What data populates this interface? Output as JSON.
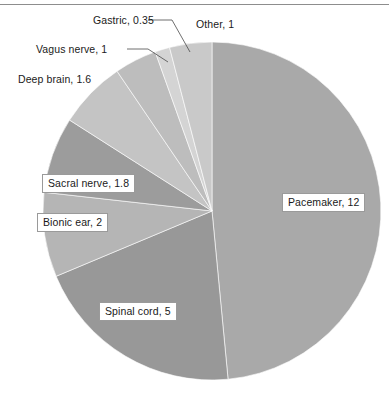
{
  "figure": {
    "rule_top": true,
    "caption_fragment": ""
  },
  "chart_data": {
    "type": "pie",
    "title": "",
    "subtitle": "",
    "xlabel": "",
    "ylabel": "",
    "grid": false,
    "legend_position": "none",
    "value_unit": "",
    "total": 24.75,
    "label_format": "name, value",
    "start_angle_deg": 0,
    "direction": "clockwise",
    "categories": [
      "Pacemaker",
      "Spinal cord",
      "Bionic ear",
      "Sacral nerve",
      "Deep brain",
      "Vagus nerve",
      "Gastric",
      "Other"
    ],
    "values": [
      12,
      5,
      2,
      1.8,
      1.6,
      1,
      0.35,
      1
    ],
    "colors": [
      "#a9a9a9",
      "#989898",
      "#b5b5b5",
      "#9c9c9c",
      "#c4c4c4",
      "#bdbdbd",
      "#d4d4d4",
      "#c9c9c9"
    ],
    "data_labels": [
      "Pacemaker, 12",
      "Spinal cord, 5",
      "Bionic ear, 2",
      "Sacral nerve, 1.8",
      "Deep brain, 1.6",
      "Vagus nerve, 1",
      "Gastric, 0.35",
      "Other, 1"
    ]
  },
  "labels": {
    "pacemaker": "Pacemaker, 12",
    "spinal_cord": "Spinal cord, 5",
    "bionic_ear": "Bionic ear, 2",
    "sacral_nerve": "Sacral nerve, 1.8",
    "deep_brain": "Deep brain, 1.6",
    "vagus_nerve": "Vagus nerve, 1",
    "gastric": "Gastric, 0.35",
    "other": "Other, 1"
  }
}
